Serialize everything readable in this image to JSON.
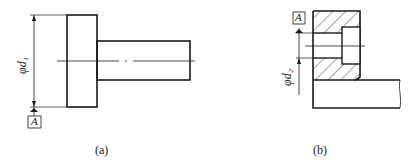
{
  "figures": [
    {
      "id": "a",
      "caption": "(a)",
      "dimension_label": "φd₁",
      "datum_label": "A"
    },
    {
      "id": "b",
      "caption": "(b)",
      "dimension_label": "φd₂",
      "datum_label": "A"
    }
  ],
  "colors": {
    "line": "#1a1a1a",
    "background": "#ffffff"
  }
}
